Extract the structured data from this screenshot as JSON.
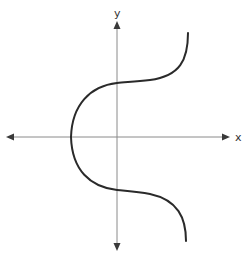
{
  "diagram": {
    "type": "graph-sketch",
    "axes": {
      "x_label": "x",
      "y_label": "y",
      "origin_px": [
        117,
        137
      ],
      "x_axis_px": {
        "from": 7,
        "to": 229,
        "y": 137,
        "arrows": "both"
      },
      "y_axis_px": {
        "from": 22,
        "to": 250,
        "x": 117,
        "arrows": "both"
      }
    },
    "curve": {
      "color": "#2a2a2a",
      "stroke_width": 2,
      "key_points_px": {
        "top_end": [
          188,
          33
        ],
        "upper_inflection_on_y_axis": [
          117,
          83
        ],
        "leftmost_point_on_x_axis": [
          71,
          137
        ],
        "lower_inflection_on_y_axis": [
          117,
          190
        ],
        "bottom_end": [
          186,
          241
        ]
      }
    },
    "colors": {
      "axis": "#8a8a8a",
      "arrow": "#3a3a3a",
      "curve": "#2a2a2a",
      "background": "#ffffff"
    }
  }
}
